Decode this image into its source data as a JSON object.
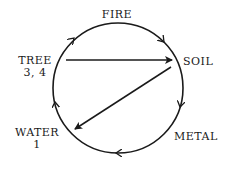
{
  "diagram": {
    "nodes": {
      "fire": {
        "label": "FIRE"
      },
      "soil": {
        "label": "SOIL"
      },
      "metal": {
        "label": "METAL"
      },
      "water": {
        "label": "WATER",
        "sub": "1"
      },
      "tree": {
        "label": "TREE",
        "sub": "3, 4"
      }
    },
    "cycle_direction": "clockwise",
    "arrows": [
      {
        "from": "TREE",
        "to": "SOIL",
        "type": "straight"
      },
      {
        "from": "SOIL",
        "to": "WATER",
        "type": "straight"
      }
    ],
    "color": "#1a1a1a"
  }
}
